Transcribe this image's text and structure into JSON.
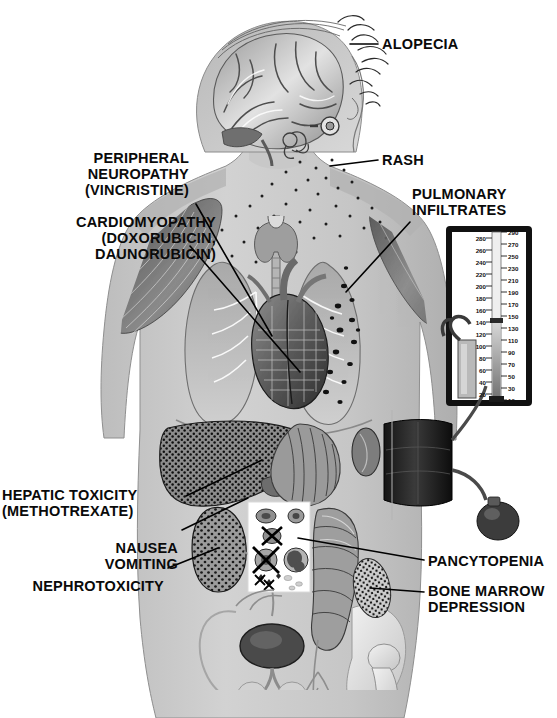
{
  "title": "Antineoplastic Agents",
  "figure": {
    "kind": "anatomical-illustration",
    "background_color": "#ffffff",
    "body_color": "#c9c9c9",
    "line_color": "#000000"
  },
  "labels": {
    "alopecia": "ALOPECIA",
    "rash": "RASH",
    "pulmonary_infiltrates": "PULMONARY\nINFILTRATES",
    "peripheral_neuropathy": "PERIPHERAL\nNEUROPATHY\n(VINCRISTINE)",
    "cardiomyopathy": "CARDIOMYOPATHY\n(DOXORUBICIN,\nDAUNORUBICIN)",
    "hepatic_toxicity": "HEPATIC TOXICITY\n(METHOTREXATE)",
    "nausea_vomiting": "NAUSEA\nVOMITING",
    "nephrotoxicity": "NEPHROTOXICITY",
    "pancytopenia": "PANCYTOPENIA",
    "bone_marrow_depression": "BONE MARROW\nDEPRESSION"
  },
  "sphygmomanometer": {
    "name": "mercury-manometer",
    "scale_left": [
      280,
      260,
      240,
      220,
      200,
      180,
      160,
      140,
      120,
      100,
      80,
      60,
      40,
      20
    ],
    "scale_right": [
      290,
      270,
      250,
      230,
      210,
      190,
      170,
      150,
      130,
      110,
      90,
      70,
      50,
      30,
      10
    ],
    "mercury_level": 110,
    "cuff": "blood-pressure-cuff",
    "bulb": "inflation-bulb"
  },
  "anatomy": [
    {
      "name": "brain",
      "region": "head"
    },
    {
      "name": "inner-ear",
      "region": "head"
    },
    {
      "name": "eye",
      "region": "head"
    },
    {
      "name": "thyroid",
      "region": "neck"
    },
    {
      "name": "trachea",
      "region": "neck"
    },
    {
      "name": "heart",
      "region": "thorax"
    },
    {
      "name": "lung-left",
      "region": "thorax"
    },
    {
      "name": "lung-right",
      "region": "thorax"
    },
    {
      "name": "liver",
      "region": "abdomen"
    },
    {
      "name": "stomach",
      "region": "abdomen"
    },
    {
      "name": "spleen",
      "region": "abdomen"
    },
    {
      "name": "kidney",
      "region": "abdomen"
    },
    {
      "name": "colon",
      "region": "abdomen"
    },
    {
      "name": "bladder",
      "region": "pelvis"
    },
    {
      "name": "pelvis-bone",
      "region": "pelvis"
    },
    {
      "name": "femur",
      "region": "pelvis"
    },
    {
      "name": "bone-marrow-patch",
      "region": "pelvis"
    },
    {
      "name": "blood-cell-inset",
      "region": "abdomen"
    },
    {
      "name": "shoulder-muscle",
      "region": "shoulder"
    }
  ]
}
